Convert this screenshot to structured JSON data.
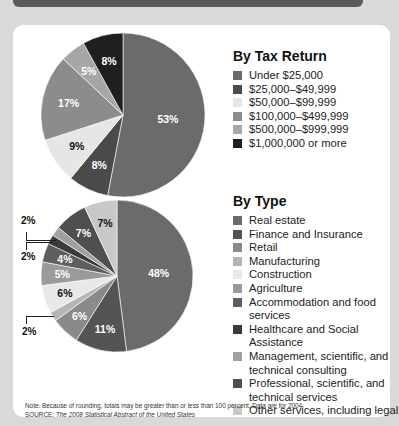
{
  "chart_data": [
    {
      "type": "pie",
      "title": "By Tax Return",
      "categories": [
        "Under $25,000",
        "$25,000–$49,999",
        "$50,000–$99,999",
        "$100,000–$499,999",
        "$500,000–$999,999",
        "$1,000,000 or more"
      ],
      "values": [
        53,
        8,
        9,
        17,
        5,
        8
      ],
      "unit": "%",
      "start_angle": "12 o'clock, clockwise",
      "legend_position": "right"
    },
    {
      "type": "pie",
      "title": "By Type",
      "categories": [
        "Real estate",
        "Finance and Insurance",
        "Retail",
        "Manufacturing",
        "Construction",
        "Agriculture",
        "Accommodation and food services",
        "Healthcare and Social Assistance",
        "Management, scientific, and technical consulting",
        "Professional, scientific, and technical services",
        "Other services, including legal"
      ],
      "values": [
        48,
        11,
        6,
        2,
        6,
        5,
        4,
        2,
        2,
        7,
        7
      ],
      "unit": "%",
      "start_angle": "12 o'clock, clockwise",
      "legend_position": "right",
      "note": "Slice-to-category mapping for mid-size slices inferred from grayscale position order"
    }
  ],
  "tax": {
    "title": "By Tax Return",
    "items": [
      {
        "label": "Under $25,000",
        "value": 53,
        "color": "#6b6b6b",
        "text": "#ffffff"
      },
      {
        "label": "$25,000–$49,999",
        "value": 8,
        "color": "#4a4a4a",
        "text": "#ffffff"
      },
      {
        "label": "$50,000–$99,999",
        "value": 9,
        "color": "#e6e6e6",
        "text": "#111111"
      },
      {
        "label": "$100,000–$499,999",
        "value": 17,
        "color": "#8c8c8c",
        "text": "#ffffff"
      },
      {
        "label": "$500,000–$999,999",
        "value": 5,
        "color": "#a6a6a6",
        "text": "#ffffff"
      },
      {
        "label": "$1,000,000 or more",
        "value": 8,
        "color": "#1f1f1f",
        "text": "#ffffff"
      }
    ]
  },
  "type": {
    "title": "By Type",
    "items": [
      {
        "label": "Real estate",
        "value": 48,
        "color": "#6b6b6b",
        "text": "#ffffff"
      },
      {
        "label": "Finance and Insurance",
        "value": 11,
        "color": "#545454",
        "text": "#ffffff"
      },
      {
        "label": "Retail",
        "value": 6,
        "color": "#8a8a8a",
        "text": "#ffffff"
      },
      {
        "label": "Manufacturing",
        "value": 2,
        "color": "#b5b5b5",
        "text": "#111111"
      },
      {
        "label": "Construction",
        "value": 6,
        "color": "#e8e8e8",
        "text": "#111111"
      },
      {
        "label": "Agriculture",
        "value": 5,
        "color": "#9a9a9a",
        "text": "#ffffff"
      },
      {
        "label": "Accommodation and food services",
        "value": 4,
        "color": "#5e5e5e",
        "text": "#ffffff"
      },
      {
        "label": "Healthcare and Social Assistance",
        "value": 2,
        "color": "#3a3a3a",
        "text": "#ffffff"
      },
      {
        "label": "Management, scientific, and technical consulting",
        "value": 2,
        "color": "#a0a0a0",
        "text": "#111111"
      },
      {
        "label": "Professional, scientific, and technical services",
        "value": 7,
        "color": "#4f4f4f",
        "text": "#ffffff"
      },
      {
        "label": "Other services, including legal",
        "value": 7,
        "color": "#c8c8c8",
        "text": "#111111"
      }
    ]
  },
  "callouts": [
    "2%",
    "2%",
    "2%"
  ],
  "footer": {
    "note": "Note: Because of rounding, totals may be greater than or less than 100 percent. Data are for 2004.",
    "source_prefix": "SOURCE: ",
    "source_title": "The 2008 Statistical Abstract of the United States"
  }
}
